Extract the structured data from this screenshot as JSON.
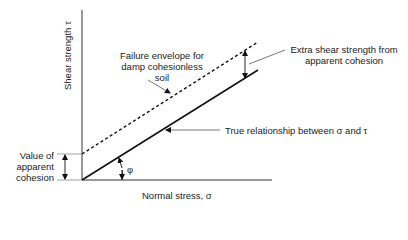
{
  "diagram": {
    "title": "",
    "axes": {
      "y_label": "Shear strength τ",
      "x_label": "Normal stress, σ"
    },
    "annotations": {
      "failure_envelope": "Failure envelope for damp cohesionless soil",
      "failure_envelope_lines": [
        "Failure envelope for",
        "damp cohesionless",
        "soil"
      ],
      "extra_strength_lines": [
        "Extra shear strength from",
        "apparent cohesion"
      ],
      "true_relationship": "True relationship between σ and τ",
      "cohesion_lines": [
        "Value of",
        "apparent",
        "cohesion"
      ],
      "angle_symbol": "φ"
    },
    "lines": [
      {
        "name": "true-relationship",
        "style": "solid",
        "from": [
          0,
          0
        ],
        "to": [
          1,
          0.62
        ]
      },
      {
        "name": "failure-envelope",
        "style": "dashed",
        "from": [
          0,
          0.15
        ],
        "to": [
          1,
          0.78
        ]
      }
    ],
    "colors": {
      "line": "#111111",
      "leader": "#555555",
      "background": "#ffffff"
    }
  }
}
